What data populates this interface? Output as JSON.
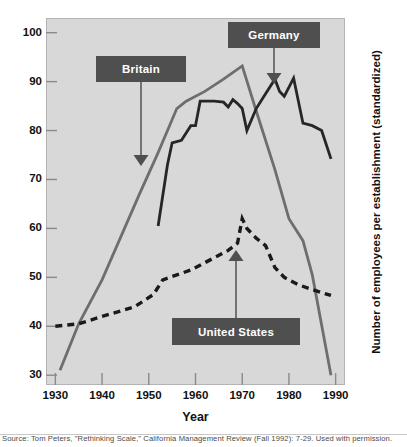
{
  "figure": {
    "background": "#ffffff",
    "panel_background": "#d8d8d8",
    "source_note": "Source: Tom Peters, \"Rethinking Scale,\" California Management Review (Fall 1992): 7-29. Used with permission."
  },
  "annotations": [
    {
      "id": "britain",
      "label": "Britain",
      "box_color": "#4f4f4f",
      "text_color": "#ffffff"
    },
    {
      "id": "germany",
      "label": "Germany",
      "box_color": "#4f4f4f",
      "text_color": "#ffffff"
    },
    {
      "id": "united-states",
      "label": "United States",
      "box_color": "#4f4f4f",
      "text_color": "#ffffff"
    }
  ],
  "chart_data": {
    "type": "line",
    "title": "",
    "subtitle": "",
    "xlabel": "Year",
    "ylabel": "Number of employees per establishment (standardized)",
    "xlim": [
      1928,
      1992
    ],
    "ylim": [
      28,
      103
    ],
    "xticks": [
      1930,
      1940,
      1950,
      1960,
      1970,
      1980,
      1990
    ],
    "xticklabels": [
      "1930",
      "1940",
      "1950",
      "1960",
      "1970",
      "1980",
      "1990"
    ],
    "yticks": [
      30,
      40,
      50,
      60,
      70,
      80,
      90,
      100
    ],
    "yticklabels": [
      "30",
      "40",
      "50",
      "60",
      "70",
      "80",
      "90",
      "100"
    ],
    "grid": false,
    "legend": "none (inline callout labels)",
    "series": [
      {
        "name": "Britain",
        "style": "solid",
        "color": "#6e6e6e",
        "x": [
          1931,
          1935,
          1940,
          1948,
          1952,
          1956,
          1958,
          1962,
          1966,
          1970,
          1973,
          1977,
          1980,
          1983,
          1985,
          1989
        ],
        "values": [
          31.0,
          40.5,
          49.5,
          67.0,
          75.5,
          84.5,
          86.0,
          88.0,
          90.5,
          93.2,
          84.0,
          72.0,
          62.0,
          57.5,
          50.5,
          30.0
        ]
      },
      {
        "name": "Germany",
        "style": "solid",
        "color": "#262626",
        "x": [
          1952,
          1954,
          1955,
          1957,
          1959,
          1960,
          1961,
          1964,
          1966,
          1967,
          1968,
          1969,
          1970,
          1971,
          1973,
          1975,
          1977,
          1978,
          1979,
          1981,
          1983,
          1985,
          1987,
          1989
        ],
        "values": [
          60.5,
          73.0,
          77.5,
          78.0,
          81.0,
          81.0,
          86.0,
          86.0,
          85.8,
          84.8,
          86.3,
          85.5,
          84.5,
          80.0,
          84.5,
          87.5,
          90.5,
          88.0,
          87.0,
          90.7,
          81.5,
          81.0,
          80.0,
          74.2
        ]
      },
      {
        "name": "United States",
        "style": "dashed",
        "color": "#1a1a1a",
        "x": [
          1930,
          1935,
          1940,
          1947,
          1951,
          1953,
          1956,
          1959,
          1962,
          1965,
          1967,
          1969,
          1970,
          1971,
          1973,
          1975,
          1977,
          1979,
          1982,
          1985,
          1989
        ],
        "values": [
          40.0,
          40.5,
          42.0,
          44.0,
          46.5,
          49.5,
          50.5,
          51.5,
          53.0,
          54.5,
          55.5,
          57.0,
          62.0,
          60.0,
          58.0,
          56.5,
          52.0,
          50.0,
          48.5,
          47.5,
          46.3
        ]
      }
    ]
  }
}
